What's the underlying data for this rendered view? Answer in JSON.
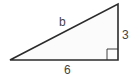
{
  "figure": {
    "type": "right-triangle",
    "vertices": {
      "left": [
        10,
        60
      ],
      "top_right": [
        118,
        4
      ],
      "right_angle": [
        118,
        60
      ]
    },
    "right_angle_marker_size": 11,
    "stroke_color": "#2b2b2b",
    "fill_color": "#fbfbfb",
    "labels": {
      "hypotenuse": "b",
      "vertical_leg": "3",
      "horizontal_leg": "6"
    }
  }
}
